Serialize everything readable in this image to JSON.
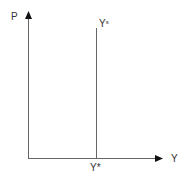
{
  "diagram": {
    "type": "economics-supply-curve",
    "axes": {
      "y_label": "P",
      "x_label": "Y"
    },
    "curves": [
      {
        "name": "long-run aggregate supply",
        "label_base": "Y",
        "label_sup": "s",
        "type": "vertical"
      }
    ],
    "x_tick": {
      "label": "Y*"
    },
    "colors": {
      "axis": "#555555",
      "curve": "#555555",
      "arrowhead": "#111111",
      "text": "#333333"
    }
  }
}
